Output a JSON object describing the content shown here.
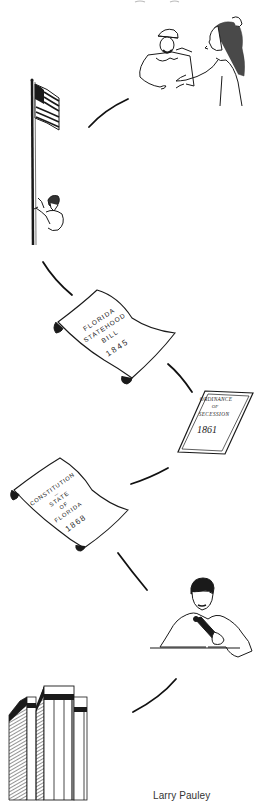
{
  "illustration": {
    "subject": "Timeline of Florida history (line-art)",
    "panels": [
      {
        "id": "first-contact",
        "description": "European explorer greeting Native American",
        "icon": "meeting-icon"
      },
      {
        "id": "flag-raising",
        "description": "Man raising U.S. flag on pole",
        "icon": "flag-icon"
      },
      {
        "id": "statehood-bill",
        "lines": [
          "FLORIDA",
          "STATEHOOD",
          "BILL"
        ],
        "year": "1845",
        "icon": "scroll-icon"
      },
      {
        "id": "secession",
        "lines": [
          "ORDINANCE",
          "OF",
          "SECESSION"
        ],
        "year": "1861",
        "icon": "document-icon"
      },
      {
        "id": "constitution",
        "lines": [
          "CONSTITUTION",
          "—",
          "STATE",
          "OF",
          "FLORIDA"
        ],
        "year": "1868",
        "icon": "scroll-icon"
      },
      {
        "id": "speaker",
        "description": "Man speaking into microphone at desk",
        "icon": "microphone-icon"
      },
      {
        "id": "capitol",
        "description": "Modern high-rise capitol building",
        "icon": "building-icon"
      }
    ],
    "connector_color": "#111111",
    "credit": "Larry Pauley"
  }
}
